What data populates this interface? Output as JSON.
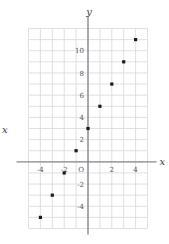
{
  "chart_data": {
    "type": "scatter",
    "title": "",
    "xlabel": "x",
    "ylabel": "y",
    "xlim": [
      -5,
      5
    ],
    "ylim": [
      -6,
      12
    ],
    "grid": true,
    "grid_step": 1,
    "legend": "none",
    "origin_label": "O",
    "x_ticks": [
      -4,
      -2,
      2,
      4
    ],
    "x_tick_labels": [
      "-4",
      "-2",
      "2",
      "4"
    ],
    "y_ticks": [
      2,
      4,
      6,
      8,
      10,
      -2,
      -4
    ],
    "y_tick_labels": [
      "2",
      "4",
      "6",
      "8",
      "10",
      "-2",
      "-4"
    ],
    "points": [
      {
        "x": -4,
        "y": -5
      },
      {
        "x": -3,
        "y": -3
      },
      {
        "x": -2,
        "y": -1
      },
      {
        "x": -1,
        "y": 1
      },
      {
        "x": 0,
        "y": 3
      },
      {
        "x": 1,
        "y": 5
      },
      {
        "x": 2,
        "y": 7
      },
      {
        "x": 3,
        "y": 9
      },
      {
        "x": 4,
        "y": 11
      }
    ],
    "marker": "square",
    "marker_color": "#1a1a1a",
    "grid_color": "#d8d8dc",
    "axis_color": "#8a8a8f"
  },
  "labels": {
    "y_axis_name": "y",
    "x_axis_name_right": "x",
    "x_axis_name_left": "x"
  }
}
